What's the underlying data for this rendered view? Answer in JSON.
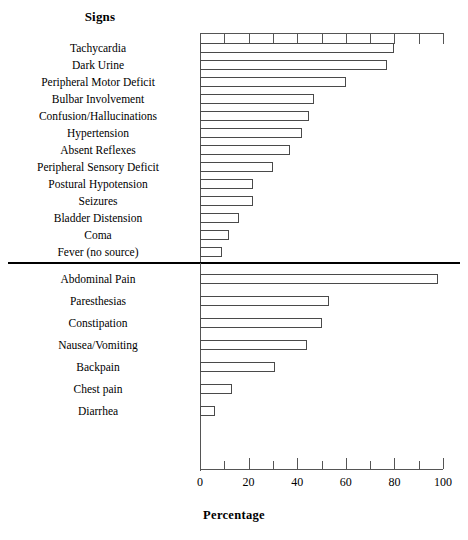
{
  "figure": {
    "axis_title": "Percentage",
    "sections": [
      {
        "key": "signs",
        "title": "Signs"
      },
      {
        "key": "symptoms",
        "title": "Symptoms"
      }
    ],
    "tick_labels": [
      "0",
      "20",
      "40",
      "60",
      "80",
      "100"
    ]
  },
  "chart_data": {
    "type": "bar",
    "title": "",
    "orientation": "horizontal",
    "xlabel": "Percentage",
    "ylabel": "",
    "xlim": [
      0,
      100
    ],
    "xticks": [
      0,
      20,
      40,
      60,
      80,
      100
    ],
    "minor_xticks": [
      10,
      30,
      50,
      70,
      90
    ],
    "grid": false,
    "legend": "none",
    "panels": [
      {
        "name": "Signs",
        "categories": [
          "Tachycardia",
          "Dark Urine",
          "Peripheral Motor Deficit",
          "Bulbar Involvement",
          "Confusion/Hallucinations",
          "Hypertension",
          "Absent Reflexes",
          "Peripheral Sensory Deficit",
          "Postural Hypotension",
          "Seizures",
          "Bladder Distension",
          "Coma",
          "Fever (no source)"
        ],
        "values": [
          80,
          77,
          60,
          47,
          45,
          42,
          37,
          30,
          22,
          22,
          16,
          12,
          9
        ]
      },
      {
        "name": "Symptoms",
        "categories": [
          "Abdominal Pain",
          "Paresthesias",
          "Constipation",
          "Nausea/Vomiting",
          "Backpain",
          "Chest pain",
          "Diarrhea"
        ],
        "values": [
          98,
          53,
          50,
          44,
          31,
          13,
          6
        ]
      }
    ]
  }
}
